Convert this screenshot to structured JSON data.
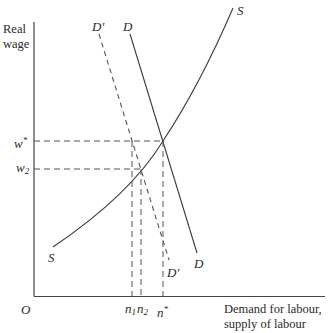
{
  "diagram": {
    "type": "labour-market supply and demand",
    "y_axis_title": [
      "Real",
      "wage"
    ],
    "x_axis_title": [
      "Demand for labour,",
      "supply of labour"
    ],
    "origin": "O",
    "curves": [
      {
        "name": "S",
        "style": "solid",
        "label_top": "S",
        "label_bottom": "S"
      },
      {
        "name": "D",
        "style": "solid",
        "label_top": "D",
        "label_bottom": "D"
      },
      {
        "name": "D'",
        "style": "dashed",
        "label_top": "D′",
        "label_bottom": "D′"
      }
    ],
    "y_ticks": [
      {
        "label_base": "w",
        "label_sup": "*",
        "level": "high"
      },
      {
        "label_base": "w",
        "label_sub": "2",
        "level": "low"
      }
    ],
    "x_ticks": [
      {
        "label_base": "n",
        "label_sub": "1"
      },
      {
        "label_base": "n",
        "label_sub": "2"
      },
      {
        "label_base": "n",
        "label_sup": "*"
      }
    ],
    "colors": {
      "line": "#3a3a3a",
      "dash": "#555555",
      "text": "#2a2a2a"
    }
  }
}
